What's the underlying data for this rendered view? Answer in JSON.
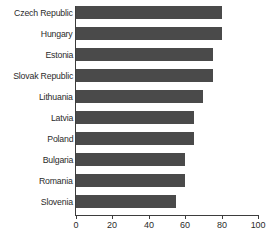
{
  "chart_data": {
    "type": "bar",
    "orientation": "horizontal",
    "title": "",
    "subtitle": "",
    "xlabel": "",
    "ylabel": "",
    "categories": [
      "Czech Republic",
      "Hungary",
      "Estonia",
      "Slovak Republic",
      "Lithuania",
      "Latvia",
      "Poland",
      "Bulgaria",
      "Romania",
      "Slovenia"
    ],
    "values": [
      80,
      80,
      75,
      75,
      70,
      65,
      65,
      60,
      60,
      55
    ],
    "xlim": [
      0,
      100
    ],
    "xticks": [
      0,
      20,
      40,
      60,
      80,
      100
    ],
    "xtick_labels": [
      "0",
      "20",
      "40",
      "60",
      "80",
      "100"
    ],
    "grid": false,
    "legend": null,
    "bar_color": "#4a4a4a",
    "axis_color": "#3d3d3d",
    "background": "#ffffff"
  }
}
